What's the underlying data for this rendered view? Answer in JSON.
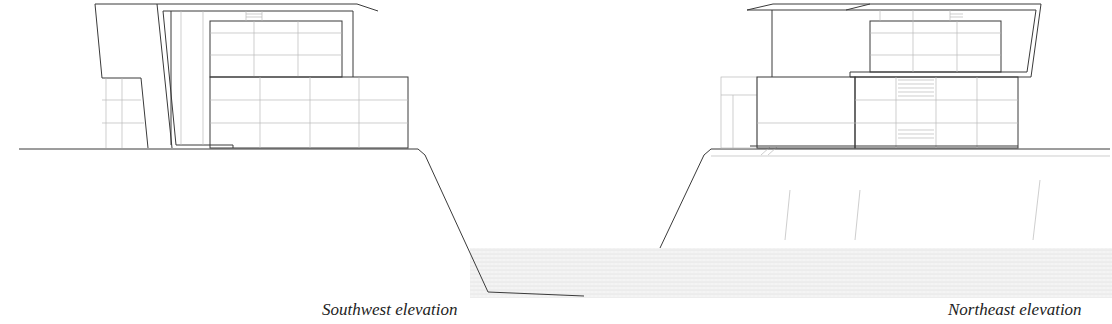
{
  "drawings": [
    {
      "id": "southwest",
      "caption": "Southwest elevation"
    },
    {
      "id": "northeast",
      "caption": "Northeast elevation"
    }
  ],
  "colors": {
    "line": "#3a3a3a",
    "light_line": "#b9b9b9",
    "hatch": "#ececec",
    "background": "#ffffff",
    "text": "#222222"
  }
}
